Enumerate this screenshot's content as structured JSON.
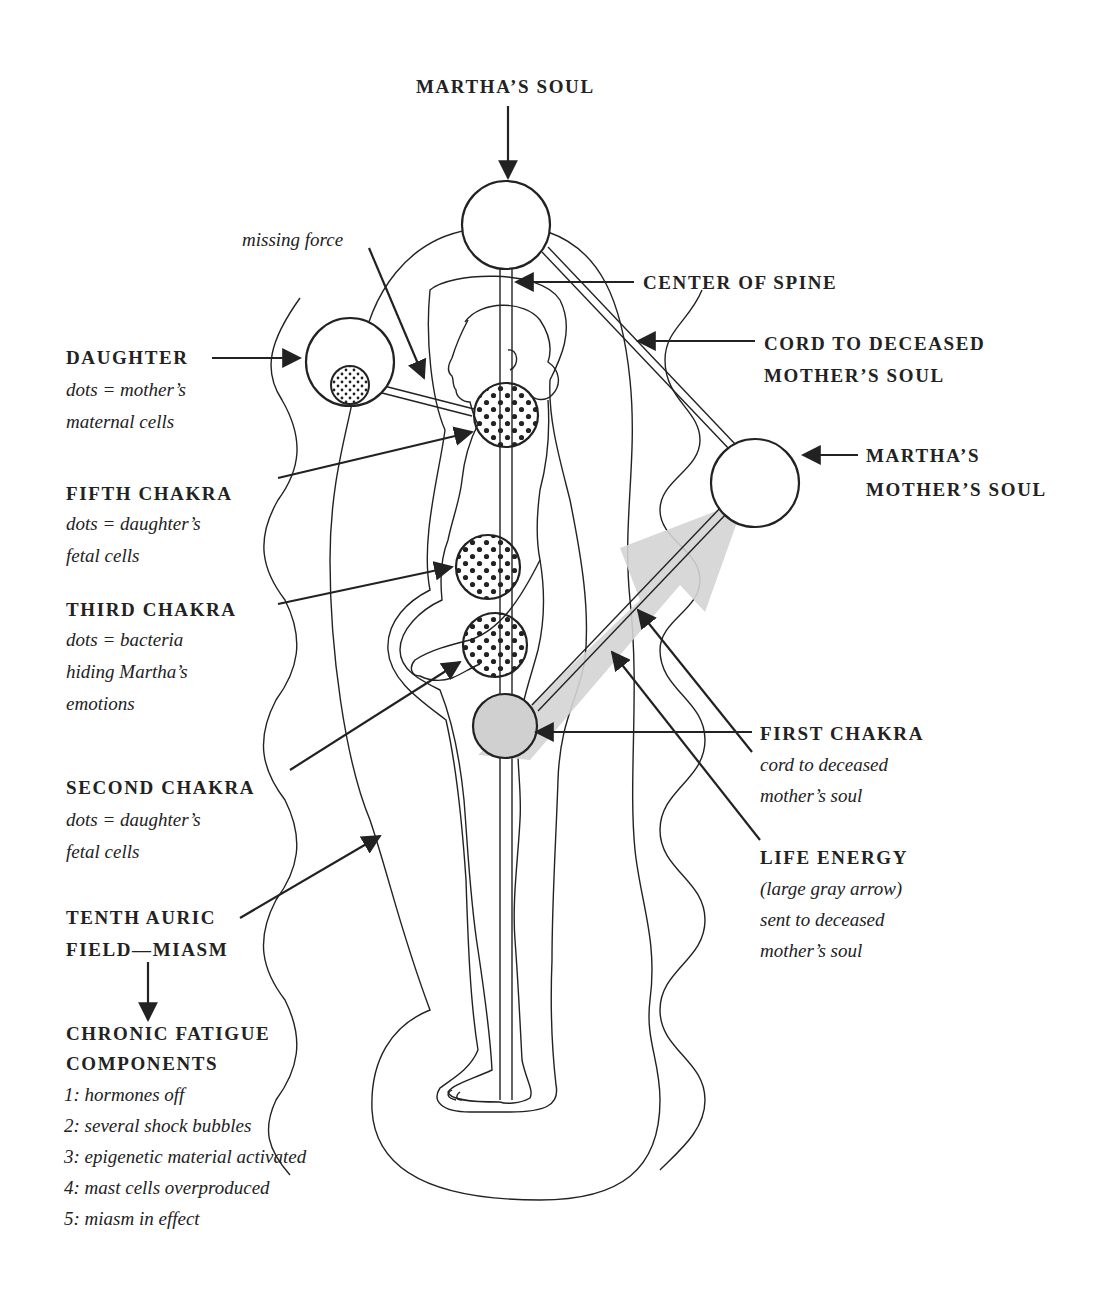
{
  "diagram": {
    "colors": {
      "ink": "#222222",
      "gray_arrow": "#d4d4d4",
      "first_chakra_fill": "#d0d0d0",
      "background": "#ffffff"
    },
    "labels": {
      "marthas_soul": "MARTHA’S SOUL",
      "missing_force": "missing force",
      "center_of_spine": "CENTER OF SPINE",
      "cord_to_deceased": {
        "line1": "CORD TO DECEASED",
        "line2": "MOTHER’S SOUL"
      },
      "daughter": {
        "title": "DAUGHTER",
        "line1": "dots = mother’s",
        "line2": "maternal cells"
      },
      "marthas_mothers_soul": {
        "line1": "MARTHA’S",
        "line2": "MOTHER’S SOUL"
      },
      "fifth_chakra": {
        "title": "FIFTH CHAKRA",
        "line1": "dots = daughter’s",
        "line2": "fetal cells"
      },
      "third_chakra": {
        "title": "THIRD CHAKRA",
        "line1": "dots = bacteria",
        "line2": "hiding Martha’s",
        "line3": "emotions"
      },
      "second_chakra": {
        "title": "SECOND CHAKRA",
        "line1": "dots = daughter’s",
        "line2": "fetal cells"
      },
      "first_chakra": {
        "title": "FIRST CHAKRA",
        "line1": "cord to deceased",
        "line2": "mother’s soul"
      },
      "life_energy": {
        "title": "LIFE ENERGY",
        "line1": "(large gray arrow)",
        "line2": "sent to deceased",
        "line3": "mother’s soul"
      },
      "tenth_auric_field": {
        "line1": "TENTH AURIC",
        "line2": "FIELD—MIASM"
      },
      "chronic_fatigue": {
        "line1": "CHRONIC FATIGUE",
        "line2": "COMPONENTS",
        "items": [
          "1: hormones off",
          "2: several shock bubbles",
          "3: epigenetic material activated",
          "4: mast cells overproduced",
          "5: miasm in effect"
        ]
      }
    }
  }
}
